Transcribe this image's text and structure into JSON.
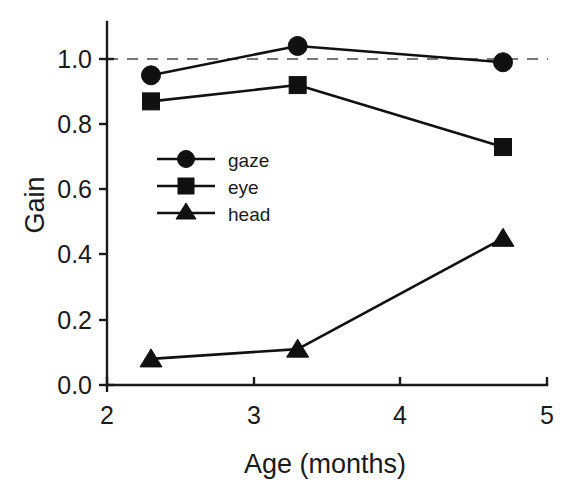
{
  "chart_data": {
    "type": "line",
    "title": "",
    "xlabel": "Age (months)",
    "ylabel": "Gain",
    "x": [
      2.3,
      3.3,
      4.7
    ],
    "xlim": [
      2,
      5
    ],
    "ylim": [
      0.0,
      1.08
    ],
    "xticks": [
      2,
      3,
      4,
      5
    ],
    "xticklabels": [
      "2",
      "3",
      "4",
      "5"
    ],
    "yticks": [
      0.0,
      0.2,
      0.4,
      0.6,
      0.8,
      1.0
    ],
    "yticklabels": [
      "0.0",
      "0.2",
      "0.4",
      "0.6",
      "0.8",
      "1.0"
    ],
    "grid": false,
    "legend_position": "center-left",
    "reference_line": {
      "y": 1.0,
      "style": "dashed",
      "color": "#777777"
    },
    "series": [
      {
        "name": "gaze",
        "marker": "circle",
        "values": [
          0.95,
          1.04,
          0.99
        ]
      },
      {
        "name": "eye",
        "marker": "square",
        "values": [
          0.87,
          0.92,
          0.73
        ]
      },
      {
        "name": "head",
        "marker": "triangle",
        "values": [
          0.08,
          0.11,
          0.45
        ]
      }
    ]
  },
  "legend": {
    "items": [
      {
        "label": "gaze",
        "marker": "circle-marker-icon"
      },
      {
        "label": "eye",
        "marker": "square-marker-icon"
      },
      {
        "label": "head",
        "marker": "triangle-marker-icon"
      }
    ]
  },
  "axes": {
    "x_title": "Age (months)",
    "y_title": "Gain",
    "x_tick_labels": [
      "2",
      "3",
      "4",
      "5"
    ],
    "y_tick_labels": [
      "0.0",
      "0.2",
      "0.4",
      "0.6",
      "0.8",
      "1.0"
    ]
  },
  "colors": {
    "ink": "#111111",
    "reference": "#777777",
    "background": "#ffffff"
  }
}
